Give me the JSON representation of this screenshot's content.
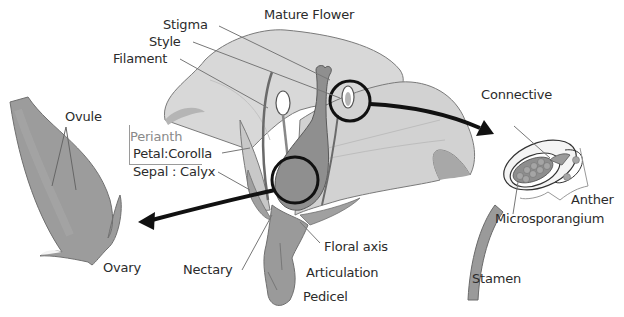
{
  "title": "Mature Flower",
  "labels": {
    "stigma": "Stigma",
    "style": "Style",
    "filament": "Filament",
    "ovule": "Ovule",
    "perianth": "Perianth",
    "petal": "Petal:Corolla",
    "sepal": "Sepal : Calyx",
    "ovary": "Ovary",
    "nectary": "Nectary",
    "floral_axis": "Floral axis",
    "articulation": "Articulation",
    "pedicel": "Pedicel",
    "connective": "Connective",
    "anther": "Anther",
    "microsporangium": "Microsporangium",
    "stamen": "Stamen"
  },
  "colors": {
    "petal_fill": "#d4d4d4",
    "petal_stroke": "#7a7a7a",
    "pistil_fill": "#8f8f8f",
    "ovary_fill": "#9a9a9a",
    "highlight_ring": "#111111",
    "arrow": "#111111",
    "leader_line": "#777777",
    "text": "#2b2b2b",
    "perianth_text": "#8a8a8a"
  },
  "callouts": [
    {
      "from": "ovary-zoom-circle",
      "to": "ovary-detail",
      "icon": "arrow-left-icon"
    },
    {
      "from": "anther-zoom-circle",
      "to": "stamen-detail",
      "icon": "arrow-right-icon"
    }
  ]
}
